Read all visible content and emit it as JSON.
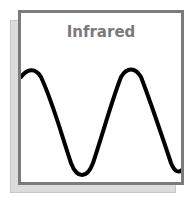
{
  "diagram": {
    "title": "Infrared",
    "wave": {
      "stroke_color": "#000000",
      "stroke_width": 4,
      "description": "sine wave, approx 1.5 cycles, peaks near x=30 and x=125, troughs near x=75 and x=175"
    },
    "colors": {
      "frame_border": "#7b7b7b",
      "shadow": "#dcdcdc",
      "title": "#7a7a7a"
    }
  }
}
